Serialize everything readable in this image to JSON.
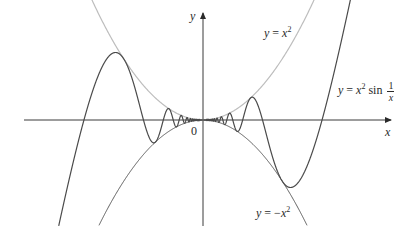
{
  "figure": {
    "colors": {
      "axes": "#3a3a3a",
      "main_curve": "#4a4a4a",
      "upper_bound": "#bdbdbd",
      "lower_bound": "#5a5a5a",
      "text": "#2a2a2a"
    },
    "axes": {
      "x_label": "x",
      "y_label": "y",
      "origin_label": "0"
    },
    "curves": [
      {
        "name": "upper-bound",
        "label_y": "y",
        "label_eq": "=",
        "label_var": "x",
        "label_exp": "2"
      },
      {
        "name": "main",
        "label_y": "y",
        "label_eq": "=",
        "label_var": "x",
        "label_exp": "2",
        "label_fn": "sin",
        "label_num": "1",
        "label_den": "x"
      },
      {
        "name": "lower-bound",
        "label_y": "y",
        "label_eq": "= −",
        "label_var": "x",
        "label_exp": "2"
      }
    ]
  }
}
